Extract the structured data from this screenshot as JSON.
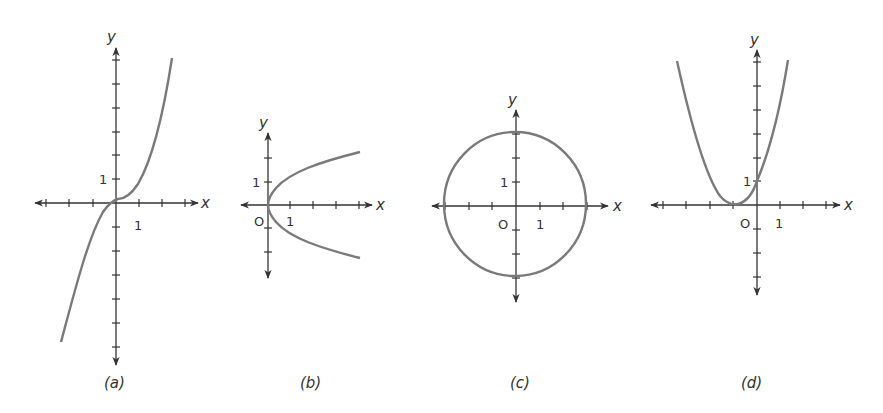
{
  "figure": {
    "axis_color": "#333333",
    "curve_color": "#7a7a7a",
    "panels": [
      {
        "id": "a",
        "caption": "(a)",
        "x_label": "x",
        "y_label": "y",
        "tick_x_label": "1",
        "tick_y_label": "1",
        "origin_label": "",
        "curve": "cubic, y ≈ 0.42x³ + 0.2"
      },
      {
        "id": "b",
        "caption": "(b)",
        "x_label": "x",
        "y_label": "y",
        "tick_x_label": "1",
        "tick_y_label": "1",
        "origin_label": "O",
        "curve": "sideways parabola, x = y²"
      },
      {
        "id": "c",
        "caption": "(c)",
        "x_label": "x",
        "y_label": "y",
        "tick_x_label": "1",
        "tick_y_label": "1",
        "origin_label": "O",
        "curve": "circle, x² + y² = 9"
      },
      {
        "id": "d",
        "caption": "(d)",
        "x_label": "x",
        "y_label": "y",
        "tick_x_label": "1",
        "tick_y_label": "1",
        "origin_label": "O",
        "curve": "parabola, y = (x + 1)²"
      }
    ]
  }
}
